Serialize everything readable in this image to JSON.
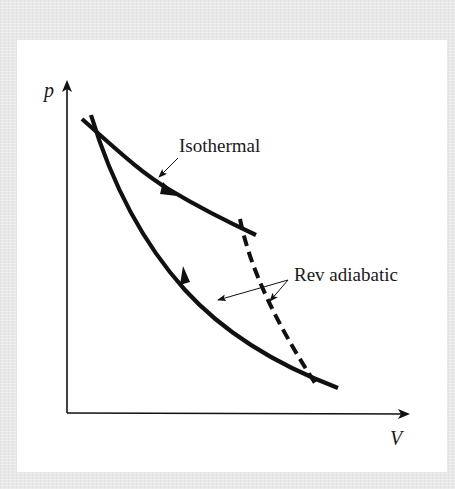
{
  "figure": {
    "axes": {
      "y_label": "p",
      "x_label": "V"
    },
    "annotations": {
      "isothermal": "Isothermal",
      "adiabatic": "Rev adiabatic"
    },
    "curves": [
      {
        "name": "Isothermal",
        "style": "solid",
        "direction": "rightward / expansion"
      },
      {
        "name": "Rev adiabatic (lower)",
        "style": "solid",
        "direction": "leftward / compression"
      },
      {
        "name": "Rev adiabatic (connecting)",
        "style": "dashed"
      }
    ],
    "colors": {
      "line": "#111111",
      "background_frame": "#e8e8e8",
      "panel": "#ffffff"
    }
  }
}
